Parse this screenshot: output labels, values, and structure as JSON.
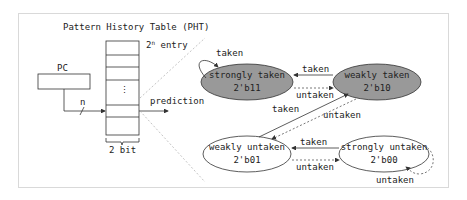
{
  "pht": {
    "title": "Pattern History Table (PHT)",
    "entry_label": "2",
    "entry_sup": "n",
    "entry_suffix": " entry",
    "dots": ":",
    "width_label": "2 bit"
  },
  "pc": {
    "label": "PC",
    "bus_label": "n"
  },
  "output": {
    "label": "prediction"
  },
  "states": [
    {
      "name": "strongly taken",
      "code": "2'b11",
      "fill": "#999999"
    },
    {
      "name": "weakly taken",
      "code": "2'b10",
      "fill": "#999999"
    },
    {
      "name": "weakly untaken",
      "code": "2'b01",
      "fill": "#ffffff"
    },
    {
      "name": "strongly untaken",
      "code": "2'b00",
      "fill": "#ffffff"
    }
  ],
  "transitions": {
    "st_self": "taken",
    "wt_to_st": "taken",
    "st_to_wt": "untaken",
    "wu_to_wt": "taken",
    "wt_to_wu": "untaken",
    "su_to_wu": "taken",
    "wu_to_su": "untaken",
    "su_self": "untaken"
  }
}
